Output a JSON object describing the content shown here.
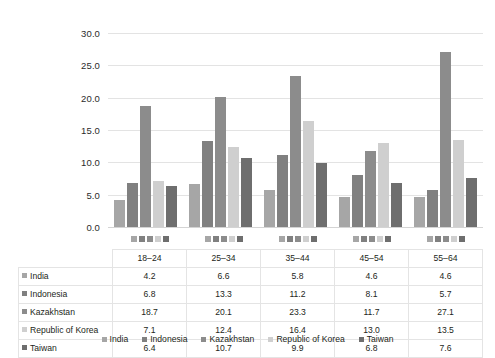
{
  "chart_data": {
    "type": "bar",
    "title": "",
    "subtitle": "",
    "xlabel": "",
    "ylabel": "",
    "categories": [
      "18–24",
      "25–34",
      "35–44",
      "45–54",
      "55–64"
    ],
    "series": [
      {
        "name": "India",
        "color": "#a6a6a6",
        "values": [
          4.2,
          6.6,
          5.8,
          4.6,
          4.6
        ]
      },
      {
        "name": "Indonesia",
        "color": "#808080",
        "values": [
          6.8,
          13.3,
          11.2,
          8.1,
          5.7
        ]
      },
      {
        "name": "Kazakhstan",
        "color": "#8c8c8c",
        "values": [
          18.7,
          20.1,
          23.3,
          11.7,
          27.1
        ]
      },
      {
        "name": "Republic of Korea",
        "color": "#cfcfcf",
        "values": [
          7.1,
          12.4,
          16.4,
          13.0,
          13.5
        ]
      },
      {
        "name": "Taiwan",
        "color": "#6e6e6e",
        "values": [
          6.4,
          10.7,
          9.9,
          6.8,
          7.6
        ]
      }
    ],
    "ylim": [
      0,
      30
    ],
    "ytick_step": 5,
    "ytick_labels": [
      "0.0",
      "5.0",
      "10.0",
      "15.0",
      "20.0",
      "25.0",
      "30.0"
    ],
    "grid": true,
    "legend_position": "bottom",
    "value_format": "one-decimal"
  },
  "table": {
    "column_headers": [
      "",
      "18–24",
      "25–34",
      "35–44",
      "45–54",
      "55–64"
    ],
    "rows": [
      {
        "label": "India",
        "color": "#a6a6a6",
        "values": [
          "4.2",
          "6.6",
          "5.8",
          "4.6",
          "4.6"
        ]
      },
      {
        "label": "Indonesia",
        "color": "#808080",
        "values": [
          "6.8",
          "13.3",
          "11.2",
          "8.1",
          "5.7"
        ]
      },
      {
        "label": "Kazakhstan",
        "color": "#8c8c8c",
        "values": [
          "18.7",
          "20.1",
          "23.3",
          "11.7",
          "27.1"
        ]
      },
      {
        "label": "Republic of Korea",
        "color": "#cfcfcf",
        "values": [
          "7.1",
          "12.4",
          "16.4",
          "13.0",
          "13.5"
        ]
      },
      {
        "label": "Taiwan",
        "color": "#6e6e6e",
        "values": [
          "6.4",
          "10.7",
          "9.9",
          "6.8",
          "7.6"
        ]
      }
    ]
  },
  "legend": {
    "items": [
      {
        "label": "India",
        "color": "#a6a6a6"
      },
      {
        "label": "Indonesia",
        "color": "#808080"
      },
      {
        "label": "Kazakhstan",
        "color": "#8c8c8c"
      },
      {
        "label": "Republic of Korea",
        "color": "#cfcfcf"
      },
      {
        "label": "Taiwan",
        "color": "#6e6e6e"
      }
    ]
  },
  "colors": {
    "gridline": "#e3e3e3",
    "text": "#231f20",
    "background": "#ffffff",
    "table_border": "#e4e4e4"
  }
}
